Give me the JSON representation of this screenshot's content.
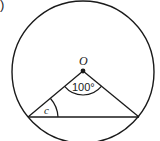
{
  "figure": {
    "part_marker": ")",
    "center_label": "O",
    "central_angle_label": "100°",
    "inscribed_angle_label": "c",
    "colors": {
      "stroke": "#1a1a1a",
      "background": "#ffffff"
    }
  }
}
